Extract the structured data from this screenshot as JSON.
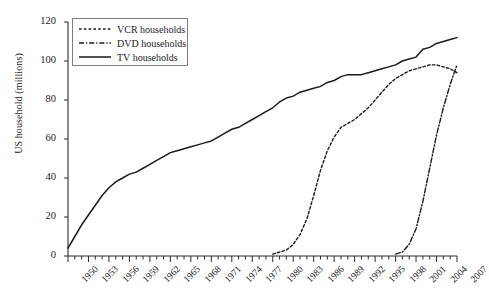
{
  "chart_data": {
    "type": "line",
    "title": "",
    "xlabel": "",
    "ylabel": "US household (millions)",
    "xlim": [
      1950,
      2007
    ],
    "ylim": [
      0,
      120
    ],
    "ytick_step": 20,
    "xtick_step": 3,
    "grid": false,
    "legend_position": "top-left",
    "yticks": [
      "0",
      "20",
      "40",
      "60",
      "80",
      "100",
      "120"
    ],
    "xticks": [
      "1950",
      "1953",
      "1956",
      "1959",
      "1962",
      "1965",
      "1968",
      "1971",
      "1974",
      "1977",
      "1980",
      "1983",
      "1986",
      "1989",
      "1992",
      "1995",
      "1998",
      "2001",
      "2004",
      "2007"
    ],
    "series": [
      {
        "name": "VCR households",
        "style": "dotted",
        "color": "#1a1a1a",
        "x": [
          1980,
          1981,
          1982,
          1983,
          1984,
          1985,
          1986,
          1987,
          1988,
          1989,
          1990,
          1991,
          1992,
          1993,
          1994,
          1995,
          1996,
          1997,
          1998,
          1999,
          2000,
          2001,
          2002,
          2003,
          2004,
          2005,
          2006,
          2007
        ],
        "values": [
          1,
          2,
          3,
          6,
          11,
          19,
          31,
          44,
          54,
          61,
          66,
          68,
          70,
          73,
          76,
          80,
          84,
          88,
          91,
          93,
          95,
          96,
          97,
          98,
          98,
          97,
          96,
          94
        ]
      },
      {
        "name": "DVD households",
        "style": "dash-dot",
        "color": "#1a1a1a",
        "x": [
          1998,
          1999,
          2000,
          2001,
          2002,
          2003,
          2004,
          2005,
          2006,
          2007
        ],
        "values": [
          1,
          2,
          6,
          14,
          28,
          45,
          62,
          76,
          88,
          98
        ]
      },
      {
        "name": "TV households",
        "style": "solid",
        "color": "#1a1a1a",
        "x": [
          1950,
          1951,
          1952,
          1953,
          1954,
          1955,
          1956,
          1957,
          1958,
          1959,
          1960,
          1961,
          1962,
          1963,
          1964,
          1965,
          1966,
          1967,
          1968,
          1969,
          1970,
          1971,
          1972,
          1973,
          1974,
          1975,
          1976,
          1977,
          1978,
          1979,
          1980,
          1981,
          1982,
          1983,
          1984,
          1985,
          1986,
          1987,
          1988,
          1989,
          1990,
          1991,
          1992,
          1993,
          1994,
          1995,
          1996,
          1997,
          1998,
          1999,
          2000,
          2001,
          2002,
          2003,
          2004,
          2005,
          2006,
          2007
        ],
        "values": [
          4,
          10,
          16,
          21,
          26,
          31,
          35,
          38,
          40,
          42,
          43,
          45,
          47,
          49,
          51,
          53,
          54,
          55,
          56,
          57,
          58,
          59,
          61,
          63,
          65,
          66,
          68,
          70,
          72,
          74,
          76,
          79,
          81,
          82,
          84,
          85,
          86,
          87,
          89,
          90,
          92,
          93,
          93,
          93,
          94,
          95,
          96,
          97,
          98,
          100,
          101,
          102,
          106,
          107,
          109,
          110,
          111,
          112
        ]
      }
    ]
  }
}
